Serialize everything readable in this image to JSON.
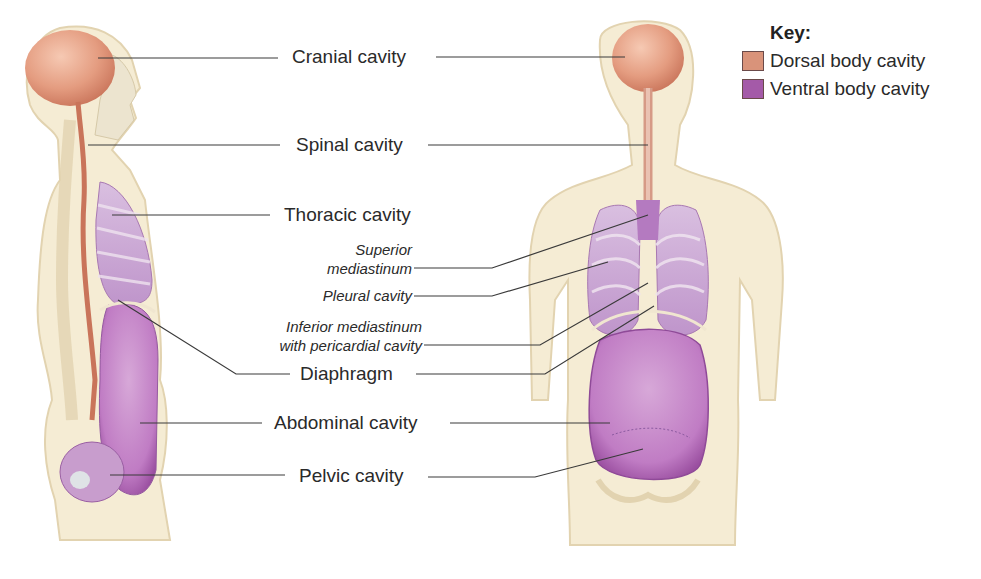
{
  "figure": {
    "views": [
      {
        "name": "lateral-view",
        "caption": ""
      },
      {
        "name": "anterior-view",
        "caption": ""
      }
    ]
  },
  "key": {
    "title": "Key:",
    "items": [
      {
        "label": "Dorsal body cavity",
        "color": "#d9937a"
      },
      {
        "label": "Ventral body cavity",
        "color": "#a45aa8"
      }
    ]
  },
  "labels": {
    "cranial": "Cranial cavity",
    "spinal": "Spinal cavity",
    "thoracic": "Thoracic cavity",
    "superior_mediastinum_1": "Superior",
    "superior_mediastinum_2": "mediastinum",
    "pleural": "Pleural cavity",
    "inferior_mediastinum_1": "Inferior mediastinum",
    "inferior_mediastinum_2": "with pericardial cavity",
    "diaphragm": "Diaphragm",
    "abdominal": "Abdominal cavity",
    "pelvic": "Pelvic cavity"
  },
  "colors": {
    "skin": "#f5ecd4",
    "skin_edge": "#e2d3b0",
    "dorsal": "#e49c80",
    "ventral": "#b877c0",
    "ventral_light": "#d3b2d8",
    "leader": "#3a3a3a"
  }
}
